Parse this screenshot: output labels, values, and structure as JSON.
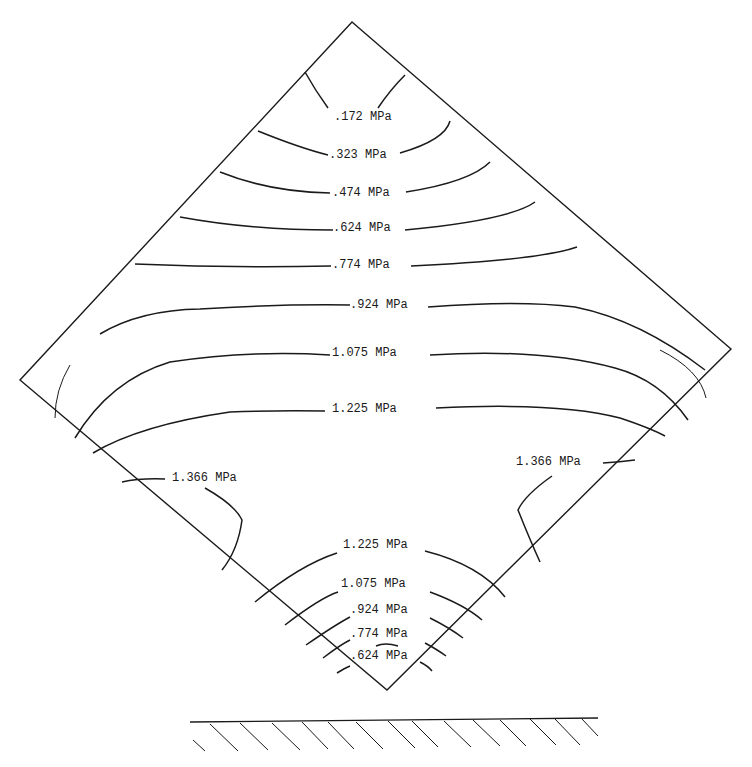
{
  "diagram": {
    "unit": "MPa",
    "contours_upper": [
      {
        "label": ".172 MPa",
        "value": 0.172
      },
      {
        "label": ".323 MPa",
        "value": 0.323
      },
      {
        "label": ".474 MPa",
        "value": 0.474
      },
      {
        "label": ".624 MPa",
        "value": 0.624
      },
      {
        "label": ".774 MPa",
        "value": 0.774
      },
      {
        "label": ".924 MPa",
        "value": 0.924
      },
      {
        "label": "1.075 MPa",
        "value": 1.075
      },
      {
        "label": "1.225 MPa",
        "value": 1.225
      }
    ],
    "contours_side": [
      {
        "label": "1.366 MPa",
        "value": 1.366,
        "side": "left"
      },
      {
        "label": "1.366 MPa",
        "value": 1.366,
        "side": "right"
      }
    ],
    "contours_lower": [
      {
        "label": "1.225 MPa",
        "value": 1.225
      },
      {
        "label": "1.075 MPa",
        "value": 1.075
      },
      {
        "label": ".924 MPa",
        "value": 0.924
      },
      {
        "label": ".774 MPa",
        "value": 0.774
      },
      {
        "label": ".624 MPa",
        "value": 0.624
      }
    ],
    "support": "hatched-ground"
  }
}
